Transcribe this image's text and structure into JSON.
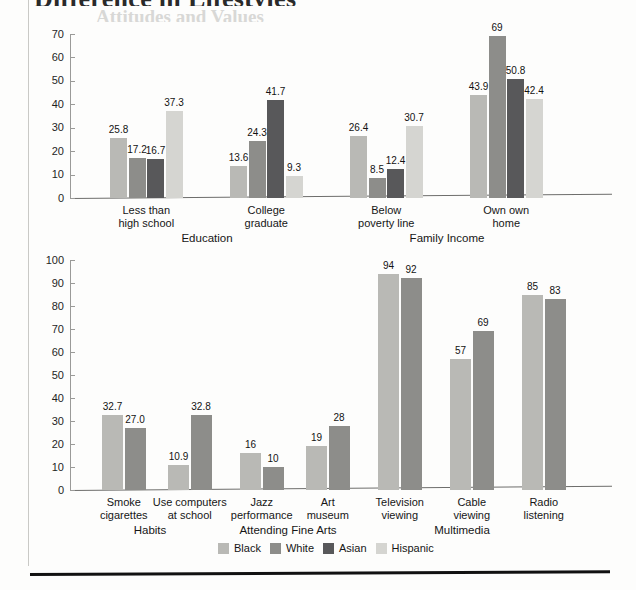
{
  "page": {
    "clipped_title": "Difference in Lifestyles",
    "clipped_subtitle": "Attitudes and Values"
  },
  "legend": {
    "items": [
      {
        "label": "Black",
        "color": "#b9b9b5"
      },
      {
        "label": "White",
        "color": "#8d8d8a"
      },
      {
        "label": "Asian",
        "color": "#58585a"
      },
      {
        "label": "Hispanic",
        "color": "#d5d5d1"
      }
    ]
  },
  "chart_data": [
    {
      "id": "top",
      "type": "bar",
      "title": "",
      "xlabel": "",
      "ylabel": "",
      "ylim": [
        0,
        70
      ],
      "ytick_step": 10,
      "yticks": [
        0,
        10,
        20,
        30,
        40,
        50,
        60,
        70
      ],
      "grid": false,
      "legend_position": "bottom-shared",
      "group_labels": [
        "Education",
        "Family Income"
      ],
      "categories": [
        "Less than\nhigh school",
        "College\ngraduate",
        "Below\npoverty line",
        "Own own\nhome"
      ],
      "series": [
        {
          "name": "Black",
          "color": "#b9b9b5",
          "values": [
            25.8,
            13.6,
            26.4,
            43.9
          ]
        },
        {
          "name": "White",
          "color": "#8d8d8a",
          "values": [
            17.2,
            24.3,
            8.5,
            69
          ]
        },
        {
          "name": "Asian",
          "color": "#58585a",
          "values": [
            16.7,
            41.7,
            12.4,
            50.8
          ]
        },
        {
          "name": "Hispanic",
          "color": "#d5d5d1",
          "values": [
            37.3,
            9.3,
            30.7,
            42.4
          ]
        }
      ],
      "value_labels": [
        [
          "25.8",
          "17.2",
          "16.7",
          "37.3"
        ],
        [
          "13.6",
          "24.3",
          "41.7",
          "9.3"
        ],
        [
          "26.4",
          "8.5",
          "12.4",
          "30.7"
        ],
        [
          "43.9",
          "69",
          "50.8",
          "42.4"
        ]
      ]
    },
    {
      "id": "bottom",
      "type": "bar",
      "title": "",
      "xlabel": "",
      "ylabel": "",
      "ylim": [
        0,
        100
      ],
      "ytick_step": 10,
      "yticks": [
        0,
        10,
        20,
        30,
        40,
        50,
        60,
        70,
        80,
        90,
        100
      ],
      "grid": false,
      "legend_position": "bottom-shared",
      "group_labels": [
        "Habits",
        "Attending Fine Arts",
        "Multimedia"
      ],
      "categories": [
        "Smoke\ncigarettes",
        "Use computers\nat school",
        "Jazz\nperformance",
        "Art\nmuseum",
        "Television\nviewing",
        "Cable\nviewing",
        "Radio\nlistening"
      ],
      "series": [
        {
          "name": "Black",
          "color": "#b9b9b5",
          "values": [
            32.7,
            10.9,
            16,
            19,
            94,
            57,
            85
          ]
        },
        {
          "name": "White",
          "color": "#8d8d8a",
          "values": [
            27.0,
            32.8,
            10,
            28,
            92,
            69,
            83
          ]
        }
      ],
      "value_labels": [
        [
          "32.7",
          "27.0"
        ],
        [
          "10.9",
          "32.8"
        ],
        [
          "16",
          "10"
        ],
        [
          "19",
          "28"
        ],
        [
          "94",
          "92"
        ],
        [
          "57",
          "69"
        ],
        [
          "85",
          "83"
        ]
      ]
    }
  ]
}
